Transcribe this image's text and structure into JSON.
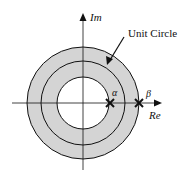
{
  "diagram": {
    "axes": {
      "horizontal_label": "Re",
      "vertical_label": "Im"
    },
    "circles": [
      {
        "name": "outer-boundary",
        "radius_relative": 1.33,
        "passes_through": "beta"
      },
      {
        "name": "unit-circle",
        "radius_relative": 1.0
      },
      {
        "name": "inner-boundary",
        "radius_relative": 0.62,
        "passes_through": "alpha"
      }
    ],
    "region": {
      "description": "shaded annulus between alpha and beta",
      "fill_color": "#d4d4d4"
    },
    "annotation": {
      "text": "Unit Circle",
      "points_to": "unit-circle"
    },
    "poles": [
      {
        "label": "α",
        "position_on_real_axis": "alpha",
        "marker": "x"
      },
      {
        "label": "β",
        "position_on_real_axis": "beta",
        "marker": "x"
      }
    ],
    "colors": {
      "stroke": "#111111",
      "shade": "#d4d4d4",
      "background": "#ffffff"
    }
  }
}
